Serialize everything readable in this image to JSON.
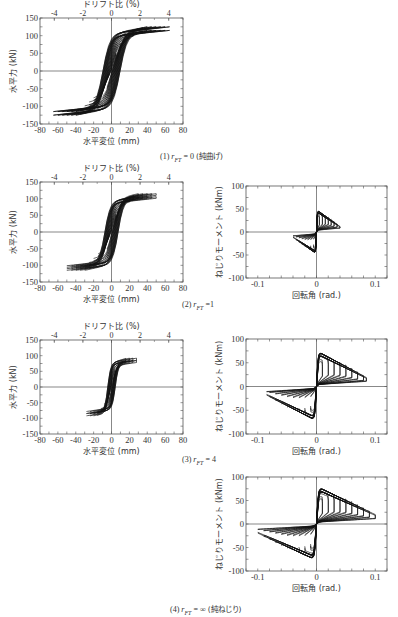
{
  "figure": {
    "panels": [
      {
        "id": "1",
        "caption_num": "(1)",
        "caption_var": "r",
        "caption_sub": "FT",
        "caption_eq": "= 0",
        "caption_note": "(純曲げ)"
      },
      {
        "id": "2",
        "caption_num": "(2)",
        "caption_var": "r",
        "caption_sub": "FT",
        "caption_eq": "=1",
        "caption_note": ""
      },
      {
        "id": "3",
        "caption_num": "(3)",
        "caption_var": "r",
        "caption_sub": "FT",
        "caption_eq": "= 4",
        "caption_note": ""
      },
      {
        "id": "4",
        "caption_num": "(4)",
        "caption_var": "r",
        "caption_sub": "FT",
        "caption_eq": "= ∞",
        "caption_note": "(純ねじり)"
      }
    ]
  },
  "chart_data": [
    {
      "panel": "(1) r_FT = 0 (純曲げ)",
      "type": "line",
      "subtype": "hysteresis",
      "xlabel": "水平変位 (mm)",
      "ylabel": "水平力 (kN)",
      "x2label": "ドリフト比 (%)",
      "xlim": [
        -80,
        80
      ],
      "ylim": [
        -150,
        150
      ],
      "xticks": [
        -80,
        -60,
        -40,
        -20,
        0,
        20,
        40,
        60,
        80
      ],
      "yticks": [
        -150,
        -100,
        -50,
        0,
        50,
        100,
        150
      ],
      "x2ticks": [
        -4,
        -2,
        0,
        2,
        4
      ],
      "peak_positive": {
        "x": 65,
        "y": 125
      },
      "peak_negative": {
        "x": -65,
        "y": -125
      },
      "amplitudes_mm": [
        5,
        10,
        15,
        20,
        25,
        30,
        35,
        40,
        45,
        50,
        55,
        60,
        65
      ],
      "max_force_kN": 125,
      "grid": false
    },
    {
      "panel": "(2) r_FT = 1 bending",
      "type": "line",
      "subtype": "hysteresis",
      "xlabel": "水平変位 (mm)",
      "ylabel": "水平力 (kN)",
      "x2label": "ドリフト比 (%)",
      "xlim": [
        -80,
        80
      ],
      "ylim": [
        -150,
        150
      ],
      "xticks": [
        -80,
        -60,
        -40,
        -20,
        0,
        20,
        40,
        60,
        80
      ],
      "yticks": [
        -150,
        -100,
        -50,
        0,
        50,
        100,
        150
      ],
      "x2ticks": [
        -4,
        -2,
        0,
        2,
        4
      ],
      "peak_positive": {
        "x": 50,
        "y": 110
      },
      "peak_negative": {
        "x": -48,
        "y": -115
      },
      "amplitudes_mm": [
        5,
        10,
        15,
        20,
        25,
        30,
        35,
        40,
        45,
        50
      ],
      "max_force_kN": 112,
      "grid": false
    },
    {
      "panel": "(2) r_FT = 1 torsion",
      "type": "line",
      "subtype": "hysteresis",
      "xlabel": "回転角 (rad.)",
      "ylabel": "ねじりモーメント (kNm)",
      "xlim": [
        -0.12,
        0.12
      ],
      "ylim": [
        -100,
        100
      ],
      "xticks": [
        -0.1,
        0,
        0.1
      ],
      "yticks": [
        -100,
        -50,
        0,
        50,
        100
      ],
      "peak_positive": {
        "x": 0.04,
        "y": 48
      },
      "peak_negative": {
        "x": -0.04,
        "y": -47
      },
      "amplitudes_rad": [
        0.005,
        0.01,
        0.015,
        0.02,
        0.025,
        0.03,
        0.035,
        0.04
      ],
      "max_moment_kNm": 48,
      "grid": false
    },
    {
      "panel": "(3) r_FT = 4 bending",
      "type": "line",
      "subtype": "hysteresis",
      "xlabel": "水平変位 (mm)",
      "ylabel": "水平力 (kN)",
      "x2label": "ドリフト比 (%)",
      "xlim": [
        -80,
        80
      ],
      "ylim": [
        -150,
        150
      ],
      "xticks": [
        -80,
        -60,
        -40,
        -20,
        0,
        20,
        40,
        60,
        80
      ],
      "yticks": [
        -150,
        -100,
        -50,
        0,
        50,
        100,
        150
      ],
      "x2ticks": [
        -4,
        -2,
        0,
        2,
        4
      ],
      "peak_positive": {
        "x": 28,
        "y": 92
      },
      "peak_negative": {
        "x": -28,
        "y": -85
      },
      "amplitudes_mm": [
        4,
        8,
        12,
        16,
        20,
        24,
        28
      ],
      "max_force_kN": 92,
      "grid": false
    },
    {
      "panel": "(3) r_FT = 4 torsion",
      "type": "line",
      "subtype": "hysteresis",
      "xlabel": "回転角 (rad.)",
      "ylabel": "ねじりモーメント (kNm)",
      "xlim": [
        -0.12,
        0.12
      ],
      "ylim": [
        -100,
        100
      ],
      "xticks": [
        -0.1,
        0,
        0.1
      ],
      "yticks": [
        -100,
        -50,
        0,
        50,
        100
      ],
      "peak_positive": {
        "x": 0.085,
        "y": 75
      },
      "peak_negative": {
        "x": -0.085,
        "y": -72
      },
      "amplitudes_rad": [
        0.01,
        0.02,
        0.03,
        0.04,
        0.05,
        0.06,
        0.07,
        0.08,
        0.085
      ],
      "max_moment_kNm": 75,
      "grid": false
    },
    {
      "panel": "(4) r_FT = ∞ (純ねじり)",
      "type": "line",
      "subtype": "hysteresis",
      "xlabel": "回転角 (rad.)",
      "ylabel": "ねじりモーメント (kNm)",
      "xlim": [
        -0.12,
        0.12
      ],
      "ylim": [
        -100,
        100
      ],
      "xticks": [
        -0.1,
        0,
        0.1
      ],
      "yticks": [
        -100,
        -50,
        0,
        50,
        100
      ],
      "peak_positive": {
        "x": 0.1,
        "y": 80
      },
      "peak_negative": {
        "x": -0.1,
        "y": -77
      },
      "amplitudes_rad": [
        0.01,
        0.02,
        0.03,
        0.04,
        0.05,
        0.06,
        0.07,
        0.08,
        0.09,
        0.1
      ],
      "max_moment_kNm": 80,
      "grid": false
    }
  ],
  "layout": {
    "plots": [
      {
        "ref": 0,
        "left": 40,
        "top": 18,
        "width": 143,
        "height": 106
      },
      {
        "ref": 1,
        "left": 40,
        "top": 182,
        "width": 143,
        "height": 100
      },
      {
        "ref": 2,
        "left": 246,
        "top": 186,
        "width": 141,
        "height": 92
      },
      {
        "ref": 3,
        "left": 40,
        "top": 340,
        "width": 143,
        "height": 94
      },
      {
        "ref": 4,
        "left": 246,
        "top": 339,
        "width": 141,
        "height": 95
      },
      {
        "ref": 5,
        "left": 246,
        "top": 477,
        "width": 141,
        "height": 94
      }
    ],
    "captions": [
      {
        "panel": 0,
        "left": 160,
        "top": 150
      },
      {
        "panel": 1,
        "left": 182,
        "top": 300
      },
      {
        "panel": 2,
        "left": 182,
        "top": 455
      },
      {
        "panel": 3,
        "left": 170,
        "top": 603
      }
    ]
  }
}
